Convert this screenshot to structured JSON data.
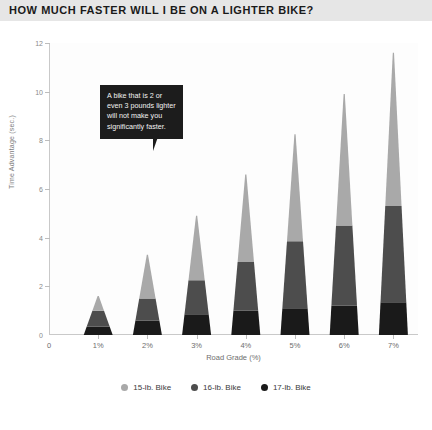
{
  "title": "HOW MUCH FASTER WILL I BE ON A LIGHTER BIKE?",
  "callout": {
    "text": "A bike that is 2 or\neven 3 pounds lighter\nwill not make you\nsignificantly faster."
  },
  "colors": {
    "title_band": "#e6e6e6",
    "series_15lb": "#a9a9a9",
    "series_16lb": "#4d4d4d",
    "series_17lb": "#1a1a1a",
    "axis": "#c9c9c9",
    "plot_bg": "#fdfdfd"
  },
  "legend": {
    "items": [
      {
        "label": "15-lb. Bike",
        "color": "#a9a9a9"
      },
      {
        "label": "16-lb. Bike",
        "color": "#4d4d4d"
      },
      {
        "label": "17-lb. Bike",
        "color": "#1a1a1a"
      }
    ]
  },
  "chart_data": {
    "type": "bar",
    "title": "HOW MUCH FASTER WILL I BE ON A LIGHTER BIKE?",
    "subtitle": "",
    "xlabel": "Road Grade (%)",
    "ylabel": "Time Advantage (sec.)",
    "categories": [
      "1%",
      "2%",
      "3%",
      "4%",
      "5%",
      "6%",
      "7%"
    ],
    "x_tick_labels": [
      "0",
      "1%",
      "2%",
      "3%",
      "4%",
      "5%",
      "6%",
      "7%"
    ],
    "y_tick_labels": [
      "0",
      "2",
      "4",
      "6",
      "8",
      "10",
      "12"
    ],
    "ylim": [
      0,
      12
    ],
    "xlim": [
      0,
      7.5
    ],
    "grid": false,
    "stacked": true,
    "bar_shape": "tapered-wedge",
    "legend_position": "bottom-center",
    "series": [
      {
        "name": "17-lb. Bike",
        "color": "#1a1a1a",
        "values": [
          0.35,
          0.6,
          0.85,
          1.0,
          1.1,
          1.2,
          1.35
        ]
      },
      {
        "name": "16-lb. Bike",
        "color": "#4d4d4d",
        "values": [
          0.65,
          0.9,
          1.4,
          2.0,
          2.75,
          3.3,
          3.95
        ]
      },
      {
        "name": "15-lb. Bike",
        "color": "#a9a9a9",
        "values": [
          0.6,
          1.8,
          2.65,
          3.6,
          4.4,
          5.4,
          6.3
        ]
      }
    ],
    "cumulative_tops": {
      "17-lb. Bike": [
        0.35,
        0.6,
        0.85,
        1.0,
        1.1,
        1.2,
        1.35
      ],
      "16-lb. Bike": [
        1.0,
        1.5,
        2.25,
        3.0,
        3.85,
        4.5,
        5.3
      ],
      "15-lb. Bike": [
        1.6,
        3.3,
        4.9,
        6.6,
        8.25,
        9.9,
        11.6
      ]
    },
    "annotations": [
      {
        "text": "A bike that is 2 or even 3 pounds lighter will not make you significantly faster."
      }
    ]
  }
}
